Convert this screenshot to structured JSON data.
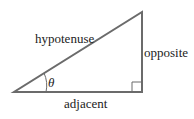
{
  "diagram": {
    "labels": {
      "hypotenuse": "hypotenuse",
      "opposite": "opposite",
      "adjacent": "adjacent",
      "angle": "θ"
    },
    "colors": {
      "stroke": "#6b6b6b",
      "text": "#222222"
    }
  }
}
